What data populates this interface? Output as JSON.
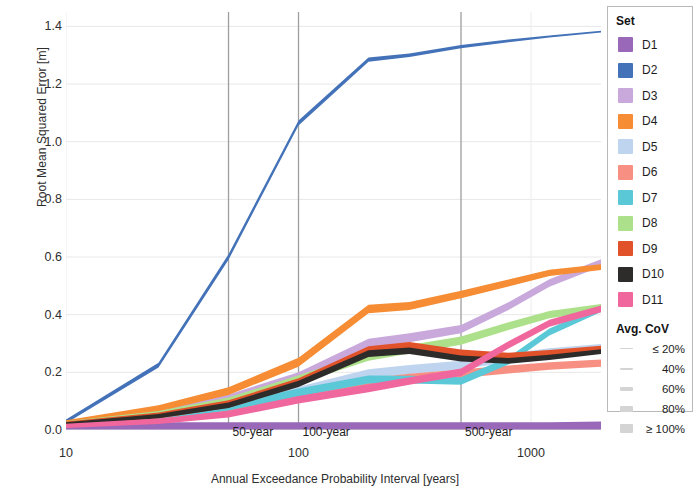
{
  "chart_data": {
    "type": "line",
    "title": "",
    "xlabel": "Annual Exceedance Probability Interval [years]",
    "ylabel": "Root Mean Squared Error [m]",
    "xscale": "log",
    "xlim": [
      10,
      2000
    ],
    "ylim": [
      0.0,
      1.45
    ],
    "xticks": [
      10,
      100,
      1000
    ],
    "xtick_labels": [
      "10",
      "100",
      "1000"
    ],
    "yticks": [
      0.0,
      0.2,
      0.4,
      0.6,
      0.8,
      1.0,
      1.2,
      1.4
    ],
    "ytick_labels": [
      "0.0",
      "0.2",
      "0.4",
      "0.6",
      "0.8",
      "1.0",
      "1.2",
      "1.4"
    ],
    "grid": true,
    "legend_position": "right",
    "reference_lines": [
      {
        "label": "50-year",
        "x": 50
      },
      {
        "label": "100-year",
        "x": 100
      },
      {
        "label": "500-year",
        "x": 500
      }
    ],
    "x": [
      10,
      25,
      50,
      100,
      200,
      300,
      500,
      800,
      1200,
      2000
    ],
    "series": [
      {
        "name": "D1",
        "color": "#9A68B8",
        "values": [
          0.01,
          0.01,
          0.01,
          0.01,
          0.01,
          0.01,
          0.01,
          0.01,
          0.01,
          0.012
        ],
        "widths": [
          0.9,
          0.9,
          0.9,
          0.9,
          0.9,
          0.9,
          0.9,
          0.9,
          0.9,
          0.9
        ]
      },
      {
        "name": "D2",
        "color": "#4372B8",
        "values": [
          0.03,
          0.225,
          0.6,
          1.065,
          1.285,
          1.3,
          1.33,
          1.35,
          1.365,
          1.382
        ],
        "widths": [
          0.35,
          0.45,
          0.5,
          0.45,
          0.38,
          0.33,
          0.28,
          0.24,
          0.2,
          0.16
        ]
      },
      {
        "name": "D3",
        "color": "#C9A9DC",
        "values": [
          0.024,
          0.06,
          0.11,
          0.185,
          0.3,
          0.32,
          0.35,
          0.43,
          0.51,
          0.58
        ],
        "widths": [
          0.4,
          0.55,
          0.7,
          0.8,
          0.85,
          0.8,
          0.75,
          0.7,
          0.68,
          0.65
        ]
      },
      {
        "name": "D4",
        "color": "#F68C33",
        "values": [
          0.026,
          0.075,
          0.135,
          0.235,
          0.42,
          0.43,
          0.47,
          0.51,
          0.545,
          0.565
        ],
        "widths": [
          0.4,
          0.55,
          0.7,
          0.8,
          0.78,
          0.72,
          0.68,
          0.62,
          0.58,
          0.52
        ]
      },
      {
        "name": "D5",
        "color": "#BFD4EE",
        "values": [
          0.02,
          0.042,
          0.075,
          0.135,
          0.195,
          0.21,
          0.225,
          0.25,
          0.27,
          0.285
        ],
        "widths": [
          0.4,
          0.55,
          0.68,
          0.78,
          0.82,
          0.82,
          0.8,
          0.76,
          0.72,
          0.68
        ]
      },
      {
        "name": "D6",
        "color": "#F79083",
        "values": [
          0.018,
          0.035,
          0.06,
          0.11,
          0.165,
          0.18,
          0.195,
          0.21,
          0.222,
          0.232
        ],
        "widths": [
          0.4,
          0.52,
          0.65,
          0.74,
          0.78,
          0.78,
          0.76,
          0.72,
          0.7,
          0.66
        ]
      },
      {
        "name": "D7",
        "color": "#5BC8D8",
        "values": [
          0.02,
          0.045,
          0.08,
          0.13,
          0.175,
          0.175,
          0.17,
          0.24,
          0.34,
          0.42
        ],
        "widths": [
          0.4,
          0.52,
          0.65,
          0.72,
          0.72,
          0.7,
          0.68,
          0.65,
          0.62,
          0.58
        ]
      },
      {
        "name": "D8",
        "color": "#ADE08A",
        "values": [
          0.023,
          0.055,
          0.1,
          0.175,
          0.255,
          0.28,
          0.31,
          0.36,
          0.4,
          0.425
        ],
        "widths": [
          0.4,
          0.55,
          0.68,
          0.76,
          0.78,
          0.76,
          0.74,
          0.7,
          0.66,
          0.62
        ]
      },
      {
        "name": "D9",
        "color": "#E2522A",
        "values": [
          0.022,
          0.05,
          0.09,
          0.165,
          0.275,
          0.29,
          0.265,
          0.255,
          0.265,
          0.28
        ],
        "widths": [
          0.4,
          0.55,
          0.68,
          0.76,
          0.8,
          0.78,
          0.74,
          0.7,
          0.66,
          0.62
        ]
      },
      {
        "name": "D10",
        "color": "#2E2B2B",
        "values": [
          0.021,
          0.048,
          0.086,
          0.16,
          0.265,
          0.275,
          0.248,
          0.24,
          0.252,
          0.272
        ],
        "widths": [
          0.3,
          0.4,
          0.5,
          0.58,
          0.62,
          0.6,
          0.56,
          0.52,
          0.48,
          0.44
        ]
      },
      {
        "name": "D11",
        "color": "#F0679E",
        "values": [
          0.014,
          0.03,
          0.055,
          0.105,
          0.145,
          0.17,
          0.2,
          0.295,
          0.37,
          0.42
        ],
        "widths": [
          0.38,
          0.5,
          0.62,
          0.7,
          0.72,
          0.7,
          0.68,
          0.66,
          0.64,
          0.6
        ]
      }
    ]
  },
  "legend": {
    "set_title": "Set",
    "items": [
      {
        "label": "D1",
        "color": "#9A68B8"
      },
      {
        "label": "D2",
        "color": "#4372B8"
      },
      {
        "label": "D3",
        "color": "#C9A9DC"
      },
      {
        "label": "D4",
        "color": "#F68C33"
      },
      {
        "label": "D5",
        "color": "#BFD4EE"
      },
      {
        "label": "D6",
        "color": "#F79083"
      },
      {
        "label": "D7",
        "color": "#5BC8D8"
      },
      {
        "label": "D8",
        "color": "#ADE08A"
      },
      {
        "label": "D9",
        "color": "#E2522A"
      },
      {
        "label": "D10",
        "color": "#2E2B2B"
      },
      {
        "label": "D11",
        "color": "#F0679E"
      }
    ],
    "cov_title": "Avg. CoV",
    "cov_items": [
      {
        "label": "≤ 20%",
        "thickness": 1
      },
      {
        "label": "40%",
        "thickness": 2
      },
      {
        "label": "60%",
        "thickness": 4
      },
      {
        "label": "80%",
        "thickness": 6
      },
      {
        "label": "≥ 100%",
        "thickness": 9
      }
    ]
  }
}
